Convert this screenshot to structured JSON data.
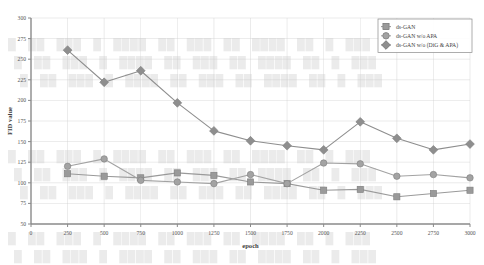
{
  "figure": {
    "background_color": "#ffffff",
    "frame_color": "#8a8a8a",
    "grid_color": "#c9c9c9"
  },
  "chart_data": {
    "type": "line",
    "title": "",
    "xlabel": "epoch",
    "ylabel": "FID value",
    "xlim": [
      0,
      3000
    ],
    "ylim": [
      50,
      300
    ],
    "xticks": [
      0,
      250,
      500,
      750,
      1000,
      1250,
      1500,
      1750,
      2000,
      2250,
      2500,
      2750,
      3000
    ],
    "yticks": [
      50,
      75,
      100,
      125,
      150,
      175,
      200,
      225,
      250,
      275,
      300
    ],
    "xtick_labels": [
      "0",
      "250",
      "500",
      "750",
      "1000",
      "1250",
      "1500",
      "1750",
      "2000",
      "2250",
      "2500",
      "2750",
      "3000"
    ],
    "ytick_labels": [
      "50",
      "75",
      "100",
      "125",
      "150",
      "175",
      "200",
      "225",
      "250",
      "275",
      "300"
    ],
    "grid": true,
    "legend_position": "top-right",
    "x": [
      250,
      500,
      750,
      1000,
      1250,
      1500,
      1750,
      2000,
      2250,
      2500,
      2750,
      3000
    ],
    "series": [
      {
        "name": "ds-GAN",
        "marker": "square",
        "color": "#9a9a9a",
        "line_color": "#9a9a9a",
        "values": [
          111,
          108,
          106,
          112,
          109,
          101,
          99,
          91,
          92,
          83,
          87,
          91
        ]
      },
      {
        "name": "ds-GAN w/o APA",
        "marker": "circle",
        "color": "#a3a3a3",
        "line_color": "#a3a3a3",
        "values": [
          120,
          129,
          103,
          101,
          99,
          110,
          99,
          124,
          123,
          108,
          110,
          106
        ]
      },
      {
        "name": "ds-GAN w/o (DiG & APA)",
        "marker": "diamond",
        "color": "#8e8e8e",
        "line_color": "#8e8e8e",
        "values": [
          261,
          222,
          236,
          197,
          163,
          151,
          145,
          140,
          174,
          154,
          140,
          147
        ]
      }
    ]
  },
  "legend": {
    "items": [
      {
        "label": "ds-GAN",
        "marker": "square"
      },
      {
        "label": "ds-GAN w/o APA",
        "marker": "circle"
      },
      {
        "label": "ds-GAN w/o (DiG & APA)",
        "marker": "diamond"
      }
    ]
  },
  "bleed_through": {
    "lines": [
      "Ā āĂă Ą ąĆćĈ",
      "ĉĊċ ČčĎď Đđ",
      "ĒēĔĕ ĖėĘęĚ",
      "ěĜĝ ĞğĠġĢģ"
    ]
  }
}
